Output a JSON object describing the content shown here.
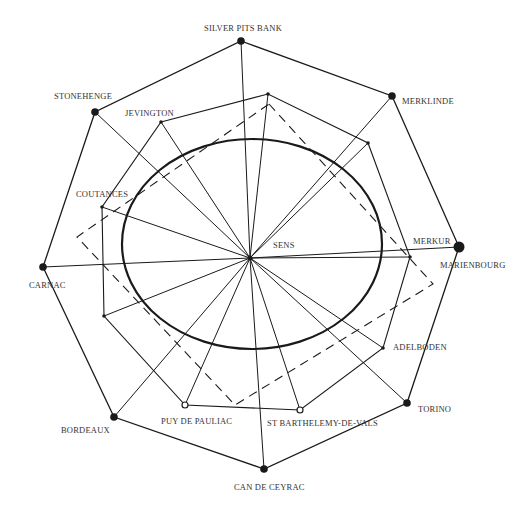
{
  "diagram": {
    "center": {
      "name": "SENS",
      "x": 250,
      "y": 258
    },
    "ellipse": {
      "cx": 252,
      "cy": 244,
      "rx": 130,
      "ry": 105,
      "stroke_width": 2.2
    },
    "colors": {
      "line": "#1a1a1a",
      "text": "#333333",
      "background": "#ffffff"
    },
    "outer_sites": [
      {
        "name": "SILVER PITS BANK",
        "x": 241,
        "y": 41,
        "marker": "filled",
        "label_x": 204,
        "label_y": 24
      },
      {
        "name": "MERKLINDE",
        "x": 392,
        "y": 96,
        "marker": "filled",
        "label_x": 402,
        "label_y": 97
      },
      {
        "name": "MARIENBOURG",
        "x": 459,
        "y": 247,
        "marker": "filled-large",
        "label_x": 440,
        "label_y": 261
      },
      {
        "name": "TORINO",
        "x": 407,
        "y": 403,
        "marker": "filled",
        "label_x": 418,
        "label_y": 405
      },
      {
        "name": "CAN DE CEYRAC",
        "x": 264,
        "y": 469,
        "marker": "filled",
        "label_x": 234,
        "label_y": 483
      },
      {
        "name": "BORDEAUX",
        "x": 114,
        "y": 417,
        "marker": "filled",
        "label_x": 61,
        "label_y": 426
      },
      {
        "name": "CARNAC",
        "x": 43,
        "y": 267,
        "marker": "filled",
        "label_x": 29,
        "label_y": 281
      },
      {
        "name": "STONEHENGE",
        "x": 95,
        "y": 112,
        "marker": "filled",
        "label_x": 54,
        "label_y": 92
      }
    ],
    "inner_sites": [
      {
        "name": "JEVINGTON",
        "x": 161,
        "y": 122,
        "marker": "dot",
        "label_x": 125,
        "label_y": 109
      },
      {
        "name": "",
        "x": 268,
        "y": 94,
        "marker": "dot"
      },
      {
        "name": "",
        "x": 368,
        "y": 143,
        "marker": "dot"
      },
      {
        "name": "MERKUR",
        "x": 410,
        "y": 257,
        "marker": "dot",
        "label_x": 413,
        "label_y": 237
      },
      {
        "name": "ADELBODEN",
        "x": 383,
        "y": 348,
        "marker": "dot",
        "label_x": 393,
        "label_y": 343
      },
      {
        "name": "ST BARTHELEMY-DE-VALS",
        "x": 300,
        "y": 410,
        "marker": "open",
        "label_x": 267,
        "label_y": 419
      },
      {
        "name": "PUY DE PAULIAC",
        "x": 185,
        "y": 405,
        "marker": "open",
        "label_x": 161,
        "label_y": 417
      },
      {
        "name": "",
        "x": 104,
        "y": 316,
        "marker": "dot"
      },
      {
        "name": "COUTANCES",
        "x": 102,
        "y": 207,
        "marker": "dot",
        "label_x": 76,
        "label_y": 190
      }
    ],
    "dashed_polygon": [
      {
        "x": 269,
        "y": 104
      },
      {
        "x": 433,
        "y": 284
      },
      {
        "x": 235,
        "y": 405
      },
      {
        "x": 77,
        "y": 237
      }
    ],
    "center_label": {
      "text": "SENS",
      "x": 273,
      "y": 241
    }
  }
}
